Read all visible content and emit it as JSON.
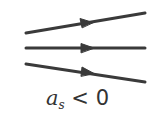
{
  "diagram": {
    "type": "flow-lines",
    "line_color": "#3a3a3a",
    "lines": [
      {
        "name": "upper-line",
        "x1": 26,
        "y1": 33,
        "x2": 145,
        "y2": 13
      },
      {
        "name": "middle-line",
        "x1": 26,
        "y1": 48,
        "x2": 145,
        "y2": 48
      },
      {
        "name": "lower-line",
        "x1": 26,
        "y1": 64,
        "x2": 145,
        "y2": 82
      }
    ],
    "arrow_direction": "right"
  },
  "label": {
    "variable": "a",
    "subscript": "s",
    "operator": " < ",
    "value": "0"
  }
}
